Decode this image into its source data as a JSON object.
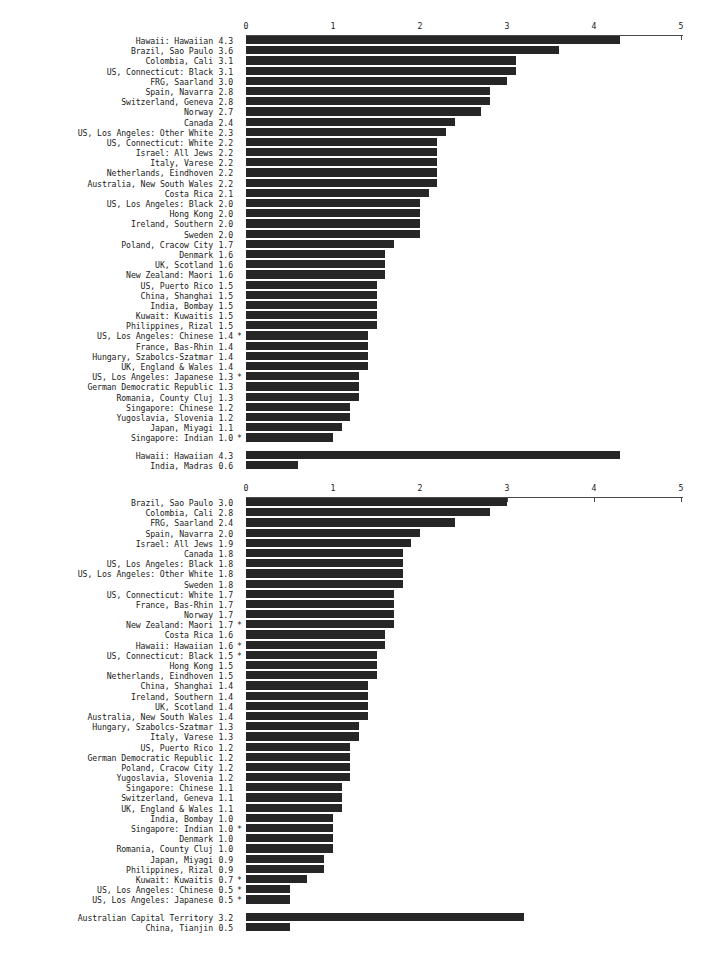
{
  "colors": {
    "bar": "#262626",
    "axis": "#4a4a4a",
    "text": "#1a1a1a",
    "background": "#ffffff"
  },
  "axis": {
    "tick_labels": [
      "0",
      "1",
      "2",
      "3",
      "4",
      "5"
    ],
    "min": 0,
    "max": 5,
    "footnote_marker": "*"
  },
  "chart_data": [
    {
      "type": "bar",
      "orientation": "horizontal",
      "title": "",
      "xlabel": "",
      "ylabel": "",
      "xlim": [
        0,
        5
      ],
      "grid": false,
      "legend": "none",
      "tick_labels": [
        "0",
        "1",
        "2",
        "3",
        "4",
        "5"
      ],
      "categories": [
        "Hawaii: Hawaiian",
        "Brazil, Sao Paulo",
        "Colombia, Cali",
        "US, Connecticut: Black",
        "FRG, Saarland",
        "Spain, Navarra",
        "Switzerland, Geneva",
        "Norway",
        "Canada",
        "US, Los Angeles: Other White",
        "US, Connecticut: White",
        "Israel: All Jews",
        "Italy, Varese",
        "Netherlands, Eindhoven",
        "Australia, New South Wales",
        "Costa Rica",
        "US, Los Angeles: Black",
        "Hong Kong",
        "Ireland, Southern",
        "Sweden",
        "Poland, Cracow City",
        "Denmark",
        "UK, Scotland",
        "New Zealand: Maori",
        "US, Puerto Rico",
        "China, Shanghai",
        "India, Bombay",
        "Kuwait: Kuwaitis",
        "Philippines, Rizal",
        "US, Los Angeles: Chinese",
        "France, Bas-Rhin",
        "Hungary, Szabolcs-Szatmar",
        "UK, England & Wales",
        "US, Los Angeles: Japanese",
        "German Democratic Republic",
        "Romania, County Cluj",
        "Singapore: Chinese",
        "Yugoslavia, Slovenia",
        "Japan, Miyagi",
        "Singapore: Indian"
      ],
      "values": [
        4.3,
        3.6,
        3.1,
        3.1,
        3.0,
        2.8,
        2.8,
        2.7,
        2.4,
        2.3,
        2.2,
        2.2,
        2.2,
        2.2,
        2.2,
        2.1,
        2.0,
        2.0,
        2.0,
        2.0,
        1.7,
        1.6,
        1.6,
        1.6,
        1.5,
        1.5,
        1.5,
        1.5,
        1.5,
        1.4,
        1.4,
        1.4,
        1.4,
        1.3,
        1.3,
        1.3,
        1.2,
        1.2,
        1.1,
        1.0
      ],
      "value_labels": [
        "4.3",
        "3.6",
        "3.1",
        "3.1",
        "3.0",
        "2.8",
        "2.8",
        "2.7",
        "2.4",
        "2.3",
        "2.2",
        "2.2",
        "2.2",
        "2.2",
        "2.2",
        "2.1",
        "2.0",
        "2.0",
        "2.0",
        "2.0",
        "1.7",
        "1.6",
        "1.6",
        "1.6",
        "1.5",
        "1.5",
        "1.5",
        "1.5",
        "1.5",
        "1.4",
        "1.4",
        "1.4",
        "1.4",
        "1.3",
        "1.3",
        "1.3",
        "1.2",
        "1.2",
        "1.1",
        "1.0"
      ],
      "stars": [
        "",
        "",
        "",
        "",
        "",
        "",
        "",
        "",
        "",
        "",
        "",
        "",
        "",
        "",
        "",
        "",
        "",
        "",
        "",
        "",
        "",
        "",
        "",
        "",
        "",
        "",
        "",
        "",
        "",
        "*",
        "",
        "",
        "",
        "*",
        "",
        "",
        "",
        "",
        "",
        "*"
      ],
      "extra_rows": {
        "categories": [
          "Hawaii: Hawaiian",
          "India, Madras"
        ],
        "values": [
          4.3,
          0.6
        ],
        "value_labels": [
          "4.3",
          "0.6"
        ],
        "stars": [
          "",
          ""
        ]
      }
    },
    {
      "type": "bar",
      "orientation": "horizontal",
      "title": "",
      "xlabel": "",
      "ylabel": "",
      "xlim": [
        0,
        5
      ],
      "grid": false,
      "legend": "none",
      "tick_labels": [
        "0",
        "1",
        "2",
        "3",
        "4",
        "5"
      ],
      "categories": [
        "Brazil, Sao Paulo",
        "Colombia, Cali",
        "FRG, Saarland",
        "Spain, Navarra",
        "Israel: All Jews",
        "Canada",
        "US, Los Angeles: Black",
        "US, Los Angeles: Other White",
        "Sweden",
        "US, Connecticut: White",
        "France, Bas-Rhin",
        "Norway",
        "New Zealand: Maori",
        "Costa Rica",
        "Hawaii: Hawaiian",
        "US, Connecticut: Black",
        "Hong Kong",
        "Netherlands, Eindhoven",
        "China, Shanghai",
        "Ireland, Southern",
        "UK, Scotland",
        "Australia, New South Wales",
        "Hungary, Szabolcs-Szatmar",
        "Italy, Varese",
        "US, Puerto Rico",
        "German Democratic Republic",
        "Poland, Cracow City",
        "Yugoslavia, Slovenia",
        "Singapore: Chinese",
        "Switzerland, Geneva",
        "UK, England & Wales",
        "India, Bombay",
        "Singapore: Indian",
        "Denmark",
        "Romania, County Cluj",
        "Japan, Miyagi",
        "Philippines, Rizal",
        "Kuwait: Kuwaitis",
        "US, Los Angeles: Chinese",
        "US, Los Angeles: Japanese"
      ],
      "values": [
        3.0,
        2.8,
        2.4,
        2.0,
        1.9,
        1.8,
        1.8,
        1.8,
        1.8,
        1.7,
        1.7,
        1.7,
        1.7,
        1.6,
        1.6,
        1.5,
        1.5,
        1.5,
        1.4,
        1.4,
        1.4,
        1.4,
        1.3,
        1.3,
        1.2,
        1.2,
        1.2,
        1.2,
        1.1,
        1.1,
        1.1,
        1.0,
        1.0,
        1.0,
        1.0,
        0.9,
        0.9,
        0.7,
        0.5,
        0.5
      ],
      "value_labels": [
        "3.0",
        "2.8",
        "2.4",
        "2.0",
        "1.9",
        "1.8",
        "1.8",
        "1.8",
        "1.8",
        "1.7",
        "1.7",
        "1.7",
        "1.7",
        "1.6",
        "1.6",
        "1.5",
        "1.5",
        "1.5",
        "1.4",
        "1.4",
        "1.4",
        "1.4",
        "1.3",
        "1.3",
        "1.2",
        "1.2",
        "1.2",
        "1.2",
        "1.1",
        "1.1",
        "1.1",
        "1.0",
        "1.0",
        "1.0",
        "1.0",
        "0.9",
        "0.9",
        "0.7",
        "0.5",
        "0.5"
      ],
      "stars": [
        "",
        "",
        "",
        "",
        "",
        "",
        "",
        "",
        "",
        "",
        "",
        "",
        "*",
        "",
        "*",
        "*",
        "",
        "",
        "",
        "",
        "",
        "",
        "",
        "",
        "",
        "",
        "",
        "",
        "",
        "",
        "",
        "",
        "*",
        "",
        "",
        "",
        "",
        "*",
        "*",
        "*"
      ],
      "extra_rows": {
        "categories": [
          "Australian Capital Territory",
          "China, Tianjin"
        ],
        "values": [
          3.2,
          0.5
        ],
        "value_labels": [
          "3.2",
          "0.5"
        ],
        "stars": [
          "",
          ""
        ]
      }
    }
  ]
}
